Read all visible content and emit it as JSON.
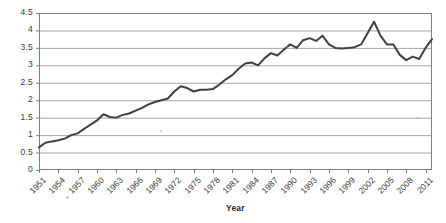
{
  "chart_data": {
    "type": "line",
    "title": "",
    "subtitle": "",
    "xlabel": "Year",
    "ylabel": "",
    "grid": true,
    "grid_axis": "y",
    "legend": false,
    "legend_position": "none",
    "line_color": "#404040",
    "line_width": 2,
    "xlim": [
      1951,
      2012
    ],
    "ylim": [
      0,
      4.5
    ],
    "ytick_step": 0.5,
    "ytick_labels": [
      "0",
      "0.5",
      "1",
      "1.5",
      "2",
      "2.5",
      "3",
      "3.5",
      "4",
      "4.5"
    ],
    "ytick_values": [
      0,
      0.5,
      1,
      1.5,
      2,
      2.5,
      3,
      3.5,
      4,
      4.5
    ],
    "xtick_labels": [
      "1951",
      "1954",
      "1957",
      "1960",
      "1963",
      "1966",
      "1969",
      "1972",
      "1975",
      "1978",
      "1981",
      "1984",
      "1987",
      "1990",
      "1993",
      "1996",
      "1999",
      "2002",
      "2005",
      "2008",
      "2011"
    ],
    "xtick_values": [
      1951,
      1954,
      1957,
      1960,
      1963,
      1966,
      1969,
      1972,
      1975,
      1978,
      1981,
      1984,
      1987,
      1990,
      1993,
      1996,
      1999,
      2002,
      2005,
      2008,
      2011
    ],
    "xtick_rotation": -45,
    "series": [
      {
        "name": "value",
        "x": [
          1951,
          1952,
          1953,
          1954,
          1955,
          1956,
          1957,
          1958,
          1959,
          1960,
          1961,
          1962,
          1963,
          1964,
          1965,
          1966,
          1967,
          1968,
          1969,
          1970,
          1971,
          1972,
          1973,
          1974,
          1975,
          1976,
          1977,
          1978,
          1979,
          1980,
          1981,
          1982,
          1983,
          1984,
          1985,
          1986,
          1987,
          1988,
          1989,
          1990,
          1991,
          1992,
          1993,
          1994,
          1995,
          1996,
          1997,
          1998,
          1999,
          2000,
          2001,
          2002,
          2003,
          2004,
          2005,
          2006,
          2007,
          2008,
          2009,
          2010,
          2011,
          2012
        ],
        "values": [
          0.65,
          0.78,
          0.82,
          0.85,
          0.9,
          1.0,
          1.05,
          1.18,
          1.3,
          1.42,
          1.6,
          1.52,
          1.5,
          1.58,
          1.62,
          1.7,
          1.78,
          1.88,
          1.95,
          2.0,
          2.05,
          2.25,
          2.4,
          2.35,
          2.25,
          2.3,
          2.3,
          2.32,
          2.45,
          2.6,
          2.72,
          2.9,
          3.05,
          3.08,
          3.0,
          3.2,
          3.35,
          3.28,
          3.45,
          3.6,
          3.5,
          3.72,
          3.78,
          3.7,
          3.85,
          3.6,
          3.5,
          3.48,
          3.5,
          3.52,
          3.6,
          3.92,
          4.25,
          3.85,
          3.6,
          3.6,
          3.3,
          3.15,
          3.25,
          3.18,
          3.5,
          3.75
        ],
        "annotations": [
          {
            "label": "series minimum at start",
            "x": 1951,
            "y": 0.65
          },
          {
            "label": "local peak",
            "x": 1961,
            "y": 1.6
          },
          {
            "label": "local dip",
            "x": 1963,
            "y": 1.5
          },
          {
            "label": "local peak",
            "x": 1973,
            "y": 2.4
          },
          {
            "label": "plateau",
            "x": 1977,
            "y": 2.3
          },
          {
            "label": "local peak",
            "x": 1984,
            "y": 3.08
          },
          {
            "label": "local dip",
            "x": 1985,
            "y": 3.0
          },
          {
            "label": "local peak",
            "x": 1995,
            "y": 3.85
          },
          {
            "label": "trough",
            "x": 1998,
            "y": 3.48
          },
          {
            "label": "global maximum",
            "x": 2003,
            "y": 4.25
          },
          {
            "label": "decline",
            "x": 2008,
            "y": 3.15
          },
          {
            "label": "sharp V dip",
            "x": 2010,
            "y": 2.82
          },
          {
            "label": "final value",
            "x": 2012,
            "y": 4.1
          }
        ]
      }
    ],
    "v_dip": {
      "x": 2010,
      "y": 2.82
    },
    "final_point": {
      "x": 2012,
      "y": 4.1
    },
    "axis_line_color": "#7f7f7f",
    "grid_line_color": "#a6a6a6",
    "plot_bg": "#ffffff"
  },
  "plot_geometry": {
    "left": 39,
    "right": 432,
    "top": 13,
    "bottom": 170
  }
}
